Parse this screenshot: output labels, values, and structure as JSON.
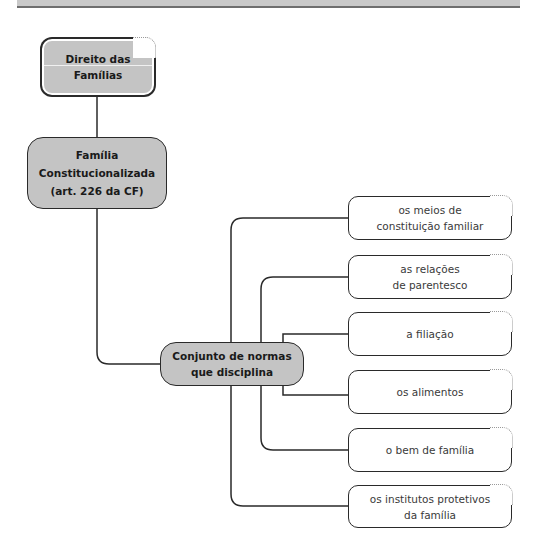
{
  "diagram": {
    "root": {
      "label_line1": "Direito das",
      "label_line2": "Famílias"
    },
    "level1": {
      "label_line1": "Família",
      "label_line2": "Constitucionalizada",
      "label_line3": "(art. 226 da CF)"
    },
    "hub": {
      "label_line1": "Conjunto de normas",
      "label_line2": "que disciplina"
    },
    "leaves": [
      {
        "line1": "os meios de",
        "line2": "constituição familiar"
      },
      {
        "line1": "as relações",
        "line2": "de parentesco"
      },
      {
        "line1": "a filiação",
        "line2": ""
      },
      {
        "line1": "os alimentos",
        "line2": ""
      },
      {
        "line1": "o bem de família",
        "line2": ""
      },
      {
        "line1": "os institutos protetivos",
        "line2": "da família"
      }
    ]
  },
  "colors": {
    "node_fill": "#c4c4c4",
    "stroke": "#2a2a2a",
    "leaf_fill": "#ffffff"
  }
}
